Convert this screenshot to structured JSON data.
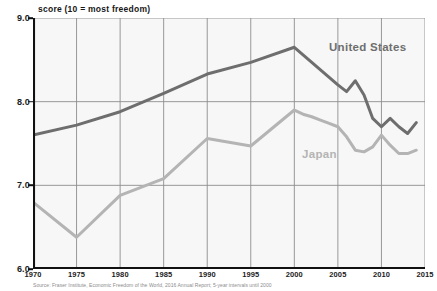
{
  "chart_data": {
    "type": "line",
    "title": "score (10 = most freedom)",
    "xlabel": "",
    "ylabel": "score (10 = most freedom)",
    "xlim": [
      1970,
      2015
    ],
    "ylim": [
      6.0,
      9.0
    ],
    "grid": true,
    "legend_position": "inline-annotations",
    "x_ticks": [
      "1970",
      "1975",
      "1980",
      "1985",
      "1990",
      "1995",
      "2000",
      "2005",
      "2010",
      "2015"
    ],
    "x_tick_values": [
      1970,
      1975,
      1980,
      1985,
      1990,
      1995,
      2000,
      2005,
      2010,
      2015
    ],
    "y_ticks": [
      "6.0",
      "7.0",
      "8.0",
      "9.0"
    ],
    "y_tick_values": [
      6.0,
      7.0,
      8.0,
      9.0
    ],
    "series": [
      {
        "name": "United States",
        "color": "#6e6e6e",
        "x": [
          1970,
          1975,
          1980,
          1985,
          1990,
          1995,
          2000,
          2001,
          2002,
          2003,
          2004,
          2005,
          2006,
          2007,
          2008,
          2009,
          2010,
          2011,
          2012,
          2013,
          2014
        ],
        "values": [
          7.6,
          7.72,
          7.88,
          8.1,
          8.33,
          8.47,
          8.65,
          8.56,
          8.47,
          8.38,
          8.29,
          8.2,
          8.12,
          8.25,
          8.08,
          7.8,
          7.7,
          7.8,
          7.7,
          7.62,
          7.75
        ]
      },
      {
        "name": "Japan",
        "color": "#b4b4b4",
        "x": [
          1970,
          1975,
          1980,
          1985,
          1990,
          1995,
          2000,
          2001,
          2002,
          2003,
          2004,
          2005,
          2006,
          2007,
          2008,
          2009,
          2010,
          2011,
          2012,
          2013,
          2014
        ],
        "values": [
          6.8,
          6.38,
          6.88,
          7.08,
          7.56,
          7.47,
          7.9,
          7.85,
          7.82,
          7.78,
          7.74,
          7.7,
          7.58,
          7.42,
          7.4,
          7.46,
          7.6,
          7.48,
          7.38,
          7.38,
          7.42
        ]
      }
    ],
    "annotations": [
      {
        "text": "United States",
        "series": "United States"
      },
      {
        "text": "Japan",
        "series": "Japan"
      }
    ]
  },
  "source_note": "Source: Fraser Institute, Economic Freedom of the World, 2016 Annual Report; 5-year intervals until 2000"
}
